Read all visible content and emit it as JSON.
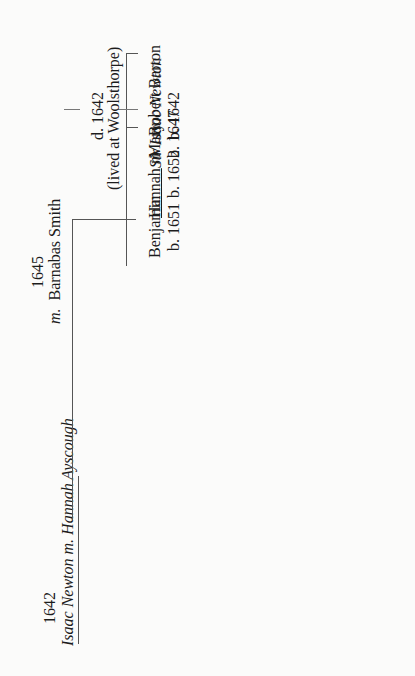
{
  "diagram": {
    "type": "family-tree",
    "orientation": "rotated-90-ccw",
    "people": {
      "isaac_sr": {
        "marriage_year": "1642",
        "name": "Isaac Newton",
        "marriage_mark": "m.",
        "death": "d. 1642",
        "note": "(lived at Woolsthorpe)"
      },
      "hannah_ayscough": {
        "name": "Hannah Ayscough"
      },
      "barnabas": {
        "marriage_year": "1645",
        "marriage_mark": "m.",
        "name": "Barnabas Smith"
      },
      "sir_isaac": {
        "title": "Sir",
        "name": "Isaac Newton",
        "birth": "b. 1642"
      },
      "mary": {
        "name": "Mary",
        "birth": "b. 1647"
      },
      "benjamin": {
        "name": "Benjamin",
        "birth": "b. 1651"
      },
      "hannah": {
        "name": "Hannah",
        "marriage_mark": "m.",
        "birth": "b. 1652"
      },
      "robert_barton": {
        "name": "Robert Barton"
      },
      "robert": {
        "name": "Robert"
      },
      "catherine": {
        "name": "Catherine",
        "birth": "b. 1679"
      },
      "john_conduitt": {
        "marriage_year": "1717",
        "name": "John Conduitt",
        "marriage_mark": "m."
      },
      "kitty": {
        "name": "Catherine (Kitty)",
        "birth": "b. 1719"
      },
      "earl": {
        "name": "1ST EARL OF PORTSMOUTH"
      },
      "john_wallop": {
        "name": "John Wallop",
        "marriage_mark": "m.",
        "title": "“Viscount Lymington”"
      }
    }
  }
}
